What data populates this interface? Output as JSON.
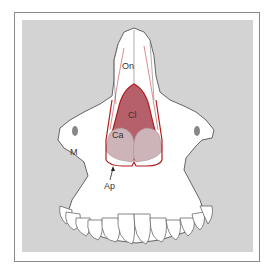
{
  "figure": {
    "type": "anatomical-diagram",
    "labels": [
      {
        "id": "On",
        "text": "On",
        "x": 128,
        "y": 69
      },
      {
        "id": "Cl",
        "text": "Cl",
        "x": 133,
        "y": 116
      },
      {
        "id": "Ca",
        "text": "Ca",
        "x": 117,
        "y": 136
      },
      {
        "id": "M",
        "text": "M",
        "x": 72,
        "y": 153
      },
      {
        "id": "Ap",
        "text": "Ap",
        "x": 112,
        "y": 186
      }
    ],
    "colors": {
      "background_panel": "#d3d3d3",
      "bone_fill": "#ffffff",
      "outline": "#555555",
      "cartilage_outline": "#b01c1c",
      "lateral_cartilage_fill": "#b5606a",
      "alar_cartilage_fill": "#cdb4b8",
      "frame_border": "#8a8a8a"
    }
  }
}
